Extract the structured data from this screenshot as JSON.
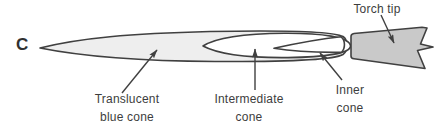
{
  "figure": {
    "panel_letter": "C",
    "labels": {
      "torch_tip": "Torch tip",
      "translucent_line1": "Translucent",
      "translucent_line2": "blue cone",
      "intermediate_line1": "Intermediate",
      "intermediate_line2": "cone",
      "inner_line1": "Inner",
      "inner_line2": "cone"
    },
    "colors": {
      "outer_cone_fill": "#eeeeee",
      "intermediate_cone_fill": "#ffffff",
      "inner_cone_fill": "#ffffff",
      "torch_tip_fill": "#c9c9c9",
      "outline": "#404040",
      "text": "#3d3d3d",
      "background": "#ffffff"
    }
  }
}
